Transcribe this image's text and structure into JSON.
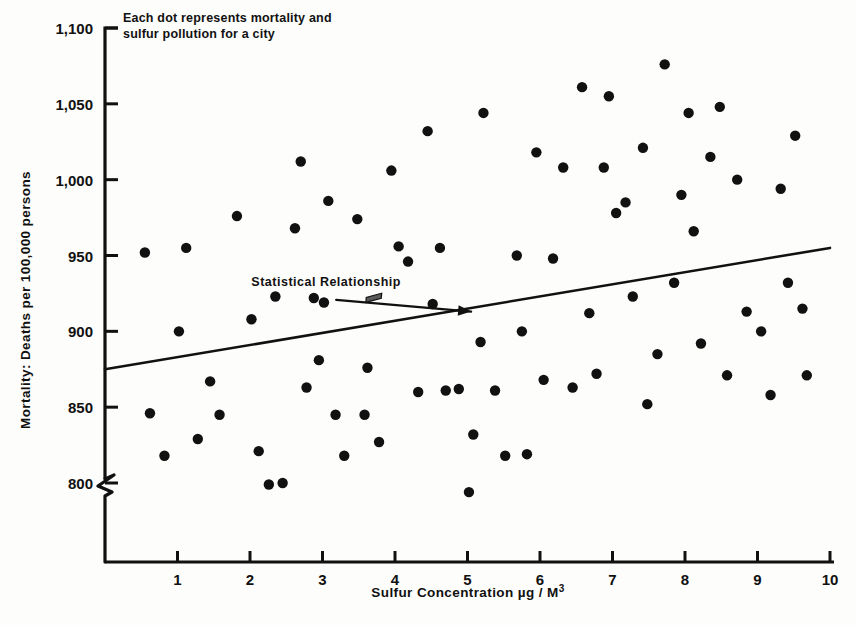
{
  "chart_data": {
    "type": "scatter",
    "title": "",
    "xlabel": "Sulfur Concentration µg / M",
    "xlabel_sup": "3",
    "ylabel": "Mortality: Deaths per 100,000 persons",
    "xlim": [
      0,
      10
    ],
    "ylim": [
      780,
      1100
    ],
    "y_axis_break": true,
    "y_break_note": "axis broken below 800",
    "grid": false,
    "legend": null,
    "xticks": [
      "1",
      "2",
      "3",
      "4",
      "5",
      "6",
      "7",
      "8",
      "9",
      "10"
    ],
    "xtick_values": [
      1,
      2,
      3,
      4,
      5,
      6,
      7,
      8,
      9,
      10
    ],
    "yticks": [
      "800",
      "850",
      "900",
      "950",
      "1,000",
      "1,050",
      "1,100"
    ],
    "ytick_values": [
      800,
      850,
      900,
      950,
      1000,
      1050,
      1100
    ],
    "annotations": [
      {
        "name": "dot-meaning-note",
        "text_line1": "Each dot represents mortality and",
        "text_line2": "sulfur pollution for a city",
        "x": 0.95,
        "y": 1092
      },
      {
        "name": "trendline-label",
        "text": "Statistical Relationship",
        "x": 3.05,
        "y": 930,
        "arrow_to_x": 5.05,
        "arrow_to_y": 913
      }
    ],
    "trendline": {
      "name": "Statistical Relationship",
      "x0": 0.0,
      "y0": 875,
      "x1": 10.0,
      "y1": 955,
      "slope": 8.0,
      "intercept": 875
    },
    "point_count": 78,
    "marker": "filled-circle",
    "marker_color": "#111111",
    "points": [
      [
        0.55,
        952
      ],
      [
        0.62,
        846
      ],
      [
        0.82,
        818
      ],
      [
        1.02,
        900
      ],
      [
        1.12,
        955
      ],
      [
        1.28,
        829
      ],
      [
        1.45,
        867
      ],
      [
        1.58,
        845
      ],
      [
        1.82,
        976
      ],
      [
        2.02,
        908
      ],
      [
        2.12,
        821
      ],
      [
        2.26,
        799
      ],
      [
        2.35,
        923
      ],
      [
        2.45,
        800
      ],
      [
        2.62,
        968
      ],
      [
        2.7,
        1012
      ],
      [
        2.78,
        863
      ],
      [
        2.95,
        881
      ],
      [
        3.02,
        919
      ],
      [
        3.08,
        986
      ],
      [
        3.18,
        845
      ],
      [
        3.3,
        818
      ],
      [
        3.48,
        974
      ],
      [
        3.58,
        845
      ],
      [
        3.62,
        876
      ],
      [
        3.78,
        827
      ],
      [
        3.95,
        1006
      ],
      [
        4.05,
        956
      ],
      [
        4.18,
        946
      ],
      [
        4.32,
        860
      ],
      [
        4.45,
        1032
      ],
      [
        4.52,
        918
      ],
      [
        4.7,
        861
      ],
      [
        4.88,
        862
      ],
      [
        5.02,
        794
      ],
      [
        5.08,
        832
      ],
      [
        5.18,
        893
      ],
      [
        5.22,
        1044
      ],
      [
        5.38,
        861
      ],
      [
        5.52,
        818
      ],
      [
        5.68,
        950
      ],
      [
        5.75,
        900
      ],
      [
        5.82,
        819
      ],
      [
        5.95,
        1018
      ],
      [
        6.05,
        868
      ],
      [
        6.18,
        948
      ],
      [
        6.32,
        1008
      ],
      [
        6.45,
        863
      ],
      [
        6.58,
        1061
      ],
      [
        6.68,
        912
      ],
      [
        6.78,
        872
      ],
      [
        6.95,
        1055
      ],
      [
        7.05,
        978
      ],
      [
        7.18,
        985
      ],
      [
        7.28,
        923
      ],
      [
        7.42,
        1021
      ],
      [
        7.48,
        852
      ],
      [
        7.62,
        885
      ],
      [
        7.72,
        1076
      ],
      [
        7.85,
        932
      ],
      [
        7.95,
        990
      ],
      [
        8.05,
        1044
      ],
      [
        8.12,
        966
      ],
      [
        8.22,
        892
      ],
      [
        8.35,
        1015
      ],
      [
        8.48,
        1048
      ],
      [
        8.58,
        871
      ],
      [
        8.72,
        1000
      ],
      [
        8.85,
        913
      ],
      [
        9.05,
        900
      ],
      [
        9.18,
        858
      ],
      [
        9.32,
        994
      ],
      [
        9.42,
        932
      ],
      [
        9.52,
        1029
      ],
      [
        9.62,
        915
      ],
      [
        9.68,
        871
      ],
      [
        4.62,
        955
      ],
      [
        2.88,
        922
      ],
      [
        6.88,
        1008
      ]
    ]
  },
  "plot_geometry": {
    "left": 105,
    "right": 830,
    "top": 28,
    "bottom": 483,
    "axis_x_line_y": 562,
    "break_y": 505
  }
}
